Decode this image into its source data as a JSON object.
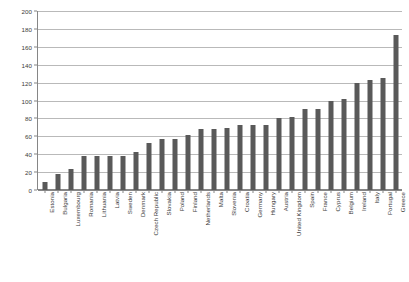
{
  "chart_data": {
    "type": "bar",
    "title": "",
    "subtitle": "",
    "xlabel": "",
    "ylabel": "",
    "ylim": [
      0,
      200
    ],
    "ytick_step": 20,
    "grid": true,
    "legend": "none",
    "bar_color": "#595959",
    "gridline_color": "#b9b9b9",
    "axis_color": "#868686",
    "yticks": [
      "200",
      "180",
      "160",
      "140",
      "120",
      "100",
      "80",
      "60",
      "40",
      "20",
      "0"
    ],
    "ytick_values": [
      200,
      180,
      160,
      140,
      120,
      100,
      80,
      60,
      40,
      20,
      0
    ],
    "categories": [
      "Estonia",
      "Bulgaria",
      "Luxembourg",
      "Romania",
      "Lithuania",
      "Latvia",
      "Sweden",
      "Denmark",
      "Czech Republic",
      "Slovakia",
      "Poland",
      "Finland",
      "Netherlands",
      "Malta",
      "Slovenia",
      "Croatia",
      "Germany",
      "Hungary",
      "Austria",
      "United Kingdom",
      "Spain",
      "France",
      "Cyprus",
      "Belgium",
      "Ireland",
      "Italy",
      "Portugal",
      "Greece"
    ],
    "values": [
      9,
      18,
      23,
      38,
      38,
      38,
      38,
      43,
      52,
      57,
      57,
      61,
      68,
      68,
      69,
      73,
      73,
      73,
      80,
      82,
      90,
      91,
      100,
      102,
      120,
      123,
      125,
      173
    ]
  }
}
